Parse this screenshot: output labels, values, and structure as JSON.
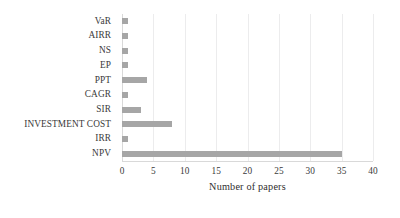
{
  "chart_data": {
    "type": "bar",
    "orientation": "horizontal",
    "title": "",
    "xlabel": "Number of papers",
    "ylabel": "",
    "categories": [
      "VaR",
      "AIRR",
      "NS",
      "EP",
      "PPT",
      "CAGR",
      "SIR",
      "INVESTMENT COST",
      "IRR",
      "NPV"
    ],
    "values": [
      1,
      1,
      1,
      1,
      4,
      1,
      3,
      8,
      1,
      35
    ],
    "xlim": [
      0,
      40
    ],
    "xticks": [
      0,
      5,
      10,
      15,
      20,
      25,
      30,
      35,
      40
    ],
    "xtick_labels": [
      "0",
      "5",
      "10",
      "15",
      "20",
      "25",
      "30",
      "35",
      "40"
    ],
    "grid": "vertical",
    "legend": "none",
    "bar_color": "#a6a6a6",
    "gridline_color": "#ececed",
    "axis_color": "#d9d9d9",
    "text_color": "#3a3a3a"
  }
}
